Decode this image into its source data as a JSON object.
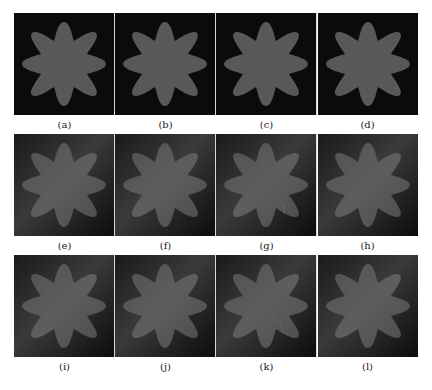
{
  "figure": {
    "rows": [
      {
        "style": "uniform",
        "panels": [
          {
            "label": "(a)",
            "variant": "uniform"
          },
          {
            "label": "(b)",
            "variant": "uniform"
          },
          {
            "label": "(c)",
            "variant": "uniform"
          },
          {
            "label": "(d)",
            "variant": "uniform"
          }
        ]
      },
      {
        "style": "inhomogeneous",
        "panels": [
          {
            "label": "(e)",
            "variant": "gradient"
          },
          {
            "label": "(f)",
            "variant": "gradient"
          },
          {
            "label": "(g)",
            "variant": "gradient"
          },
          {
            "label": "(h)",
            "variant": "gradient"
          }
        ]
      },
      {
        "style": "inhomogeneous",
        "panels": [
          {
            "label": "(i)",
            "variant": "gradient"
          },
          {
            "label": "(j)",
            "variant": "gradient"
          },
          {
            "label": "(k)",
            "variant": "gradient"
          },
          {
            "label": "(l)",
            "variant": "gradient"
          }
        ]
      }
    ],
    "shape": "eight-pointed-star",
    "colors": {
      "background_dark": "#0b0b0b",
      "star_fill": "#585858",
      "gradient_light": "#3a3a3a",
      "caption_text": "#222222"
    }
  }
}
